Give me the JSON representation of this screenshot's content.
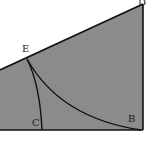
{
  "diagram": {
    "labels": {
      "D": "D",
      "E": "E",
      "C": "C",
      "B": "B"
    },
    "colors": {
      "fill": "#8b8b8b",
      "stroke": "#111111",
      "background": "#ffffff"
    }
  }
}
